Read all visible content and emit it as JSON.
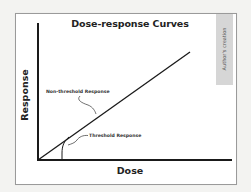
{
  "figure": {
    "title": "Dose-response Curves",
    "credit": "Author's creation",
    "x_axis_label": "Dose",
    "y_axis_label": "Response",
    "annotations": {
      "non_threshold": "Non-threshold Response",
      "threshold": "Threshold Response"
    },
    "colors": {
      "line": "#1a1a1a",
      "frame_border": "#9a9a9a",
      "credit_tab": "#d6d6d6",
      "background": "#ffffff"
    }
  },
  "diagram": {
    "type": "conceptual dose-response plot",
    "curves": [
      {
        "name": "Non-threshold Response",
        "shape": "straight line from origin"
      },
      {
        "name": "Threshold Response",
        "shape": "zero until threshold dose, then rises steeply to join linear line"
      }
    ]
  }
}
